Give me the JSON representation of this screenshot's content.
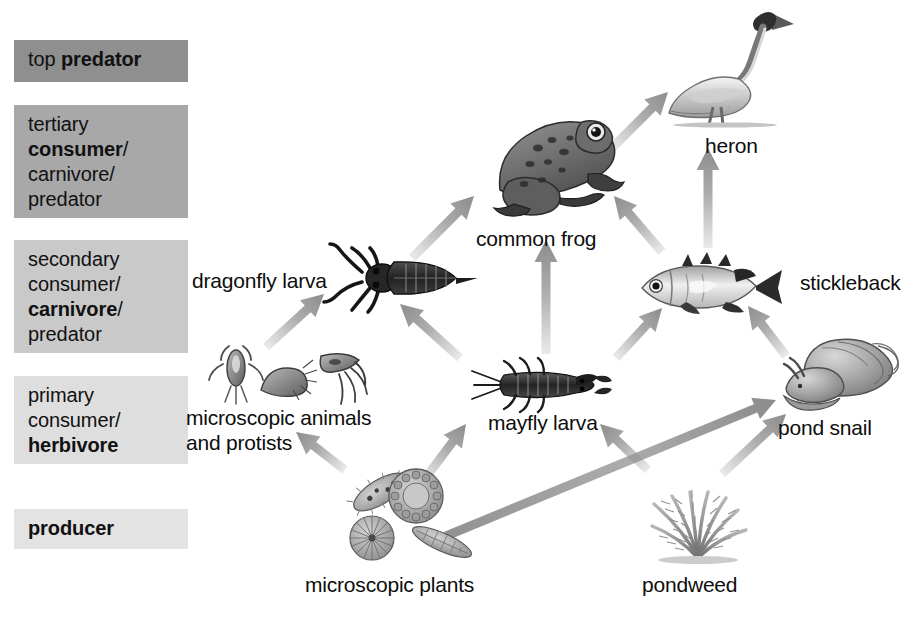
{
  "diagram": {
    "background": "#ffffff",
    "arrow_color": "#8c8c8c"
  },
  "legend": {
    "items": [
      {
        "id": "top-predator",
        "lines": [
          [
            {
              "t": "top ",
              "b": false
            },
            {
              "t": "predator",
              "b": true
            }
          ]
        ],
        "color": "#8f8f8f",
        "x": 14,
        "y": 40,
        "w": 174,
        "h": 42
      },
      {
        "id": "tertiary-consumer",
        "lines": [
          [
            {
              "t": "tertiary",
              "b": false
            }
          ],
          [
            {
              "t": "consumer",
              "b": true
            },
            {
              "t": "/",
              "b": false
            }
          ],
          [
            {
              "t": "carnivore/",
              "b": false
            }
          ],
          [
            {
              "t": "predator",
              "b": false
            }
          ]
        ],
        "color": "#a8a8a8",
        "x": 14,
        "y": 105,
        "w": 174,
        "h": 113
      },
      {
        "id": "secondary-consumer",
        "lines": [
          [
            {
              "t": "secondary",
              "b": false
            }
          ],
          [
            {
              "t": "consumer/",
              "b": false
            }
          ],
          [
            {
              "t": "carnivore",
              "b": true
            },
            {
              "t": "/",
              "b": false
            }
          ],
          [
            {
              "t": "predator",
              "b": false
            }
          ]
        ],
        "color": "#c9c9c9",
        "x": 14,
        "y": 240,
        "w": 174,
        "h": 113
      },
      {
        "id": "primary-consumer",
        "lines": [
          [
            {
              "t": "primary",
              "b": false
            }
          ],
          [
            {
              "t": "consumer/",
              "b": false
            }
          ],
          [
            {
              "t": "herbivore",
              "b": true
            }
          ]
        ],
        "color": "#dedede",
        "x": 14,
        "y": 376,
        "w": 174,
        "h": 88
      },
      {
        "id": "producer",
        "lines": [
          [
            {
              "t": "producer",
              "b": true
            }
          ]
        ],
        "color": "#e3e3e3",
        "x": 14,
        "y": 509,
        "w": 174,
        "h": 40
      }
    ]
  },
  "organisms": [
    {
      "id": "heron",
      "label": "heron",
      "label_x": 705,
      "label_y": 133,
      "art_x": 653,
      "art_y": 5,
      "art_w": 150,
      "art_h": 124
    },
    {
      "id": "common-frog",
      "label": "common frog",
      "label_x": 476,
      "label_y": 226,
      "art_x": 478,
      "art_y": 104,
      "art_w": 160,
      "art_h": 120
    },
    {
      "id": "stickleback",
      "label": "stickleback",
      "label_x": 800,
      "label_y": 270,
      "art_x": 630,
      "art_y": 252,
      "art_w": 160,
      "art_h": 72
    },
    {
      "id": "dragonfly-larva",
      "label": "dragonfly larva",
      "label_x": 192,
      "label_y": 268,
      "art_x": 318,
      "art_y": 238,
      "art_w": 170,
      "art_h": 82
    },
    {
      "id": "microscopic-animals",
      "label": "microscopic animals\nand protists",
      "label_x": 186,
      "label_y": 405,
      "art_x": 205,
      "art_y": 338,
      "art_w": 170,
      "art_h": 72
    },
    {
      "id": "mayfly-larva",
      "label": "mayfly larva",
      "label_x": 488,
      "label_y": 410,
      "art_x": 470,
      "art_y": 355,
      "art_w": 150,
      "art_h": 60
    },
    {
      "id": "pond-snail",
      "label": "pond snail",
      "label_x": 778,
      "label_y": 415,
      "art_x": 778,
      "art_y": 336,
      "art_w": 130,
      "art_h": 76
    },
    {
      "id": "microscopic-plants",
      "label": "microscopic plants",
      "label_x": 305,
      "label_y": 572,
      "art_x": 338,
      "art_y": 466,
      "art_w": 152,
      "art_h": 100
    },
    {
      "id": "pondweed",
      "label": "pondweed",
      "label_x": 642,
      "label_y": 572,
      "art_x": 628,
      "art_y": 458,
      "art_w": 140,
      "art_h": 110
    }
  ],
  "arrows": [
    {
      "id": "micro-animals-to-dragonfly",
      "from": "microscopic-animals",
      "to": "dragonfly-larva",
      "x1": 266,
      "y1": 347,
      "x2": 324,
      "y2": 294
    },
    {
      "id": "micro-plants-to-micro-animals",
      "from": "microscopic-plants",
      "to": "microscopic-animals",
      "x1": 345,
      "y1": 470,
      "x2": 296,
      "y2": 432
    },
    {
      "id": "micro-plants-to-mayfly",
      "from": "microscopic-plants",
      "to": "mayfly-larva",
      "x1": 424,
      "y1": 480,
      "x2": 466,
      "y2": 424
    },
    {
      "id": "micro-plants-to-pond-snail",
      "from": "microscopic-plants",
      "to": "pond-snail",
      "x1": 446,
      "y1": 536,
      "x2": 776,
      "y2": 400
    },
    {
      "id": "pondweed-to-mayfly",
      "from": "pondweed",
      "to": "mayfly-larva",
      "x1": 648,
      "y1": 470,
      "x2": 600,
      "y2": 424
    },
    {
      "id": "pondweed-to-pond-snail",
      "from": "pondweed",
      "to": "pond-snail",
      "x1": 722,
      "y1": 474,
      "x2": 786,
      "y2": 414
    },
    {
      "id": "dragonfly-to-frog",
      "from": "dragonfly-larva",
      "to": "common-frog",
      "x1": 412,
      "y1": 258,
      "x2": 474,
      "y2": 196
    },
    {
      "id": "mayfly-to-dragonfly",
      "from": "mayfly-larva",
      "to": "dragonfly-larva",
      "x1": 460,
      "y1": 358,
      "x2": 400,
      "y2": 304
    },
    {
      "id": "mayfly-to-frog",
      "from": "mayfly-larva",
      "to": "common-frog",
      "x1": 546,
      "y1": 354,
      "x2": 546,
      "y2": 240
    },
    {
      "id": "mayfly-to-stickleback",
      "from": "mayfly-larva",
      "to": "stickleback",
      "x1": 616,
      "y1": 358,
      "x2": 662,
      "y2": 308
    },
    {
      "id": "pond-snail-to-stickleback",
      "from": "pond-snail",
      "to": "stickleback",
      "x1": 786,
      "y1": 356,
      "x2": 748,
      "y2": 306
    },
    {
      "id": "stickleback-to-frog",
      "from": "stickleback",
      "to": "common-frog",
      "x1": 662,
      "y1": 252,
      "x2": 614,
      "y2": 196
    },
    {
      "id": "stickleback-to-heron",
      "from": "stickleback",
      "to": "heron",
      "x1": 708,
      "y1": 248,
      "x2": 708,
      "y2": 148
    },
    {
      "id": "frog-to-heron",
      "from": "common-frog",
      "to": "heron",
      "x1": 612,
      "y1": 148,
      "x2": 668,
      "y2": 92
    }
  ]
}
